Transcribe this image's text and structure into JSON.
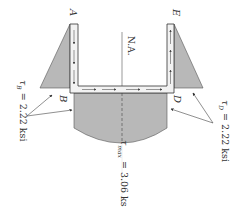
{
  "diagram": {
    "colors": {
      "fill": "#b8b8b8",
      "section_fill": "#f2f2f2",
      "line": "#333333",
      "arrow": "#555555",
      "background": "#ffffff"
    },
    "points": {
      "A": "A",
      "B": "B",
      "D": "D",
      "E": "E"
    },
    "neutral_axis_label": "N.A.",
    "annotations": {
      "tau_B": "τ_B = 2.22 ksi",
      "tau_B_symbol": "τ",
      "tau_B_sub": "B",
      "tau_B_value": " = 2.22 ksi",
      "tau_D_symbol": "τ",
      "tau_D_sub": "D",
      "tau_D_value": " = 2.22 ksi",
      "tau_max_symbol": "τ",
      "tau_max_sub": "max",
      "tau_max_value": " = 3.06 ksi"
    },
    "values": {
      "tau_B_ksi": 2.22,
      "tau_D_ksi": 2.22,
      "tau_max_ksi": 3.06
    }
  }
}
